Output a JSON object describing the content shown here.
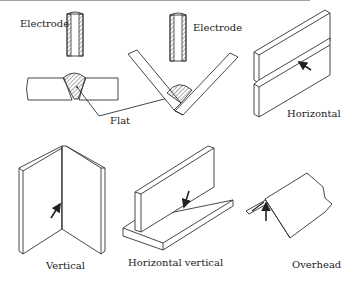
{
  "diagram": {
    "labels": {
      "electrode_left": "Electrode",
      "electrode_right": "Electrode",
      "flat": "Flat",
      "horizontal": "Horizontal",
      "vertical": "Vertical",
      "horizontal_vertical": "Horizontal vertical",
      "overhead": "Overhead"
    },
    "colors": {
      "line": "#333333",
      "hatch": "#555555",
      "background": "#ffffff"
    }
  }
}
